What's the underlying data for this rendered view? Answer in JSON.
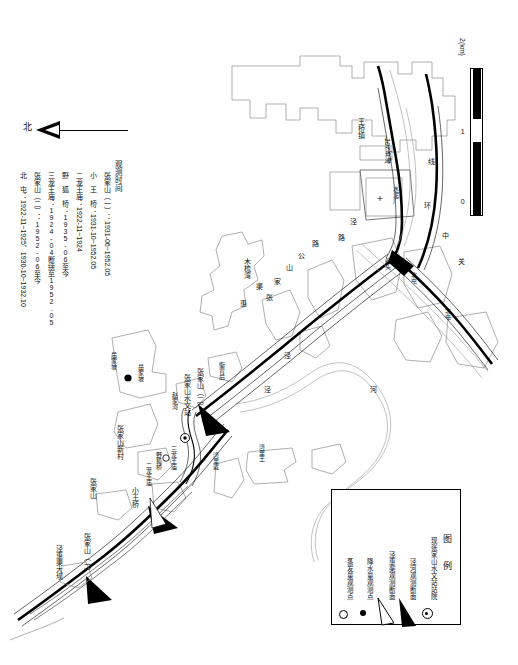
{
  "map": {
    "title_block": {
      "heading": "观测时间",
      "rows": [
        {
          "station": "张家山（一）",
          "sep": "：",
          "period": "1931-06~1952.05"
        },
        {
          "station": "小 王 桥",
          "sep": "：",
          "period": "1931-10~1952.05"
        },
        {
          "station": "二龙王庙",
          "sep": "：",
          "period": "1922-11~1924"
        },
        {
          "station": "野 狐 桥",
          "sep": "：",
          "period": "1935-06至今"
        },
        {
          "station": "三龙王庙",
          "sep": "：",
          "period": "1924-04断续至1952.05"
        },
        {
          "station": "张家山（二）",
          "sep": "：",
          "period": "1952-06至今"
        },
        {
          "station": "北 屯",
          "sep": "：",
          "period": "1922-11~1925、1930-10~1932.10"
        }
      ]
    },
    "north_arrow": {
      "label": "北"
    },
    "scale_bar": {
      "ticks": [
        "0",
        "1",
        "2(km)"
      ],
      "unit": "km"
    },
    "legend": {
      "title": "图 例",
      "items": [
        {
          "symbol": "circle-dot-icon",
          "label": "现张家山水文站站院"
        },
        {
          "symbol": "filled-wedge-icon",
          "label": "泾河观测断面"
        },
        {
          "symbol": "hollow-wedge-icon",
          "label": "泾惠渠观测断面"
        },
        {
          "symbol": "filled-dot-icon",
          "label": "降水量观测点"
        },
        {
          "symbol": "hollow-circle-icon",
          "label": "蒸发量观测点"
        }
      ]
    },
    "labels": [
      {
        "id": "zhangjiashan-dam",
        "text": "泾惠渠大坝",
        "x": 56,
        "y": 545
      },
      {
        "id": "zhangjiashan-1",
        "text": "张家山（一）",
        "x": 84,
        "y": 533
      },
      {
        "id": "zhangjiashan-village",
        "text": "张家山",
        "x": 90,
        "y": 478
      },
      {
        "id": "xiaowangqiao",
        "text": "小王桥",
        "x": 132,
        "y": 487
      },
      {
        "id": "zhangjiashan-xincun",
        "text": "张家山新村",
        "x": 117,
        "y": 425
      },
      {
        "id": "erlongwangmiao",
        "text": "二龙王庙",
        "x": 145,
        "y": 462
      },
      {
        "id": "yehuqiao",
        "text": "野狐桥",
        "x": 155,
        "y": 460
      },
      {
        "id": "sanlongwangmiao",
        "text": "三龙王庙",
        "x": 168,
        "y": 448
      },
      {
        "id": "zhaojiahe",
        "text": "赵家河",
        "x": 170,
        "y": 398
      },
      {
        "id": "zhangjiashan-station",
        "text": "张家山水文站",
        "x": 183,
        "y": 378
      },
      {
        "id": "zhangjiashan-2",
        "text": "张家山（二）",
        "x": 196,
        "y": 372
      },
      {
        "id": "yajiahou",
        "text": "衙背后",
        "x": 218,
        "y": 365
      },
      {
        "id": "yuejiapo-a",
        "text": "后家坡",
        "x": 110,
        "y": 356
      },
      {
        "id": "yuejiapo-b",
        "text": "岳家坡",
        "x": 137,
        "y": 368
      },
      {
        "id": "wanlihan",
        "text": "湾里崴",
        "x": 212,
        "y": 455
      },
      {
        "id": "wanliwang",
        "text": "湾里王",
        "x": 258,
        "y": 447
      },
      {
        "id": "jing-1",
        "text": "泾",
        "x": 264,
        "y": 388
      },
      {
        "id": "jing-2",
        "text": "泾",
        "x": 266,
        "y": 375
      },
      {
        "id": "qu",
        "text": "渠",
        "x": 250,
        "y": 280
      },
      {
        "id": "hui",
        "text": "惠",
        "x": 234,
        "y": 297
      },
      {
        "id": "zhang",
        "text": "张",
        "x": 262,
        "y": 290
      },
      {
        "id": "jia",
        "text": "家",
        "x": 268,
        "y": 276
      },
      {
        "id": "shan",
        "text": "山",
        "x": 280,
        "y": 262
      },
      {
        "id": "gong",
        "text": "公",
        "x": 292,
        "y": 250
      },
      {
        "id": "lu",
        "text": "路",
        "x": 306,
        "y": 238
      },
      {
        "id": "mushuwan",
        "text": "木梳湾",
        "x": 240,
        "y": 262
      },
      {
        "id": "he",
        "text": "河",
        "x": 370,
        "y": 390
      },
      {
        "id": "chuantou",
        "text": "船头",
        "x": 385,
        "y": 263
      },
      {
        "id": "beitun-a",
        "text": "北屯",
        "x": 408,
        "y": 275
      },
      {
        "id": "beitun-b",
        "text": "北屯",
        "x": 440,
        "y": 310
      },
      {
        "id": "guan",
        "text": "关",
        "x": 455,
        "y": 262
      },
      {
        "id": "zhong",
        "text": "中",
        "x": 440,
        "y": 236
      },
      {
        "id": "huan",
        "text": "环",
        "x": 425,
        "y": 205
      },
      {
        "id": "xian",
        "text": "线",
        "x": 430,
        "y": 160
      },
      {
        "id": "shuiniuchang",
        "text": "水泥厂",
        "x": 395,
        "y": 190
      },
      {
        "id": "sheng-dao-107",
        "text": "107省道",
        "x": 387,
        "y": 150
      },
      {
        "id": "wangqiaozhen",
        "text": "王桥镇",
        "x": 360,
        "y": 123
      },
      {
        "id": "lu-left",
        "text": "路",
        "x": 340,
        "y": 238
      },
      {
        "id": "jing-left",
        "text": "泾",
        "x": 352,
        "y": 222
      }
    ]
  }
}
